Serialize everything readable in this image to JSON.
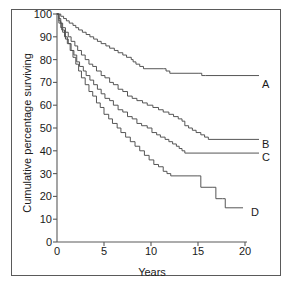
{
  "chart_data": {
    "type": "line",
    "subtype": "kaplan-meier-step",
    "title": "",
    "xlabel": "Years",
    "ylabel": "Cumulative percentage surviving",
    "xlim": [
      0,
      20
    ],
    "ylim": [
      0,
      100
    ],
    "xticks": [
      0,
      5,
      10,
      15,
      20
    ],
    "xtick_labels": [
      "0",
      "5",
      "10",
      "15",
      "20"
    ],
    "yticks": [
      0,
      10,
      20,
      30,
      40,
      50,
      60,
      70,
      80,
      90,
      100
    ],
    "ytick_labels": [
      "0",
      "10",
      "20",
      "30",
      "40",
      "50",
      "60",
      "70",
      "80",
      "90",
      "100"
    ],
    "grid": false,
    "legend_position": "right-inline",
    "line_color": "#4d4d4d",
    "axis_color": "#5a5a5a",
    "series": [
      {
        "name": "A",
        "label": "A",
        "end_value": 74,
        "points": [
          [
            0.0,
            100
          ],
          [
            0.4,
            99
          ],
          [
            0.7,
            98
          ],
          [
            1.0,
            97
          ],
          [
            1.3,
            96
          ],
          [
            1.7,
            95
          ],
          [
            2.0,
            94
          ],
          [
            2.3,
            93
          ],
          [
            2.7,
            92
          ],
          [
            3.1,
            91
          ],
          [
            3.5,
            90
          ],
          [
            3.9,
            89
          ],
          [
            4.3,
            88
          ],
          [
            4.7,
            87
          ],
          [
            5.2,
            86
          ],
          [
            5.6,
            85
          ],
          [
            6.1,
            84
          ],
          [
            6.5,
            83
          ],
          [
            7.0,
            82
          ],
          [
            7.4,
            81
          ],
          [
            7.9,
            80
          ],
          [
            8.1,
            79
          ],
          [
            8.4,
            78
          ],
          [
            8.8,
            77
          ],
          [
            9.2,
            76
          ],
          [
            11.3,
            76
          ],
          [
            11.6,
            75
          ],
          [
            12.0,
            74
          ],
          [
            15.1,
            74
          ],
          [
            15.4,
            73
          ],
          [
            15.8,
            73
          ],
          [
            20.0,
            73
          ]
        ]
      },
      {
        "name": "B",
        "label": "B",
        "end_value": 45,
        "points": [
          [
            0.0,
            100
          ],
          [
            0.2,
            98
          ],
          [
            0.4,
            96
          ],
          [
            0.6,
            94
          ],
          [
            0.9,
            92
          ],
          [
            1.2,
            90
          ],
          [
            1.5,
            88
          ],
          [
            1.9,
            86
          ],
          [
            2.2,
            84
          ],
          [
            2.6,
            82
          ],
          [
            3.0,
            80
          ],
          [
            3.4,
            78
          ],
          [
            3.8,
            77
          ],
          [
            4.2,
            75
          ],
          [
            4.7,
            73
          ],
          [
            5.1,
            72
          ],
          [
            5.6,
            70
          ],
          [
            6.0,
            69
          ],
          [
            6.5,
            67
          ],
          [
            7.0,
            66
          ],
          [
            7.5,
            64
          ],
          [
            8.0,
            63
          ],
          [
            8.5,
            62
          ],
          [
            9.1,
            61
          ],
          [
            9.6,
            60
          ],
          [
            10.2,
            59
          ],
          [
            10.8,
            58
          ],
          [
            11.3,
            57
          ],
          [
            11.9,
            56
          ],
          [
            12.4,
            55
          ],
          [
            12.9,
            54
          ],
          [
            13.3,
            53
          ],
          [
            13.6,
            51
          ],
          [
            14.0,
            50
          ],
          [
            14.4,
            49
          ],
          [
            14.8,
            48
          ],
          [
            15.3,
            47
          ],
          [
            15.7,
            46
          ],
          [
            16.1,
            45
          ],
          [
            20.0,
            45
          ]
        ]
      },
      {
        "name": "C",
        "label": "C",
        "end_value": 39,
        "points": [
          [
            0.0,
            100
          ],
          [
            0.2,
            97
          ],
          [
            0.4,
            94
          ],
          [
            0.6,
            92
          ],
          [
            0.9,
            89
          ],
          [
            1.2,
            87
          ],
          [
            1.5,
            84
          ],
          [
            1.8,
            82
          ],
          [
            2.1,
            79
          ],
          [
            2.4,
            77
          ],
          [
            2.8,
            75
          ],
          [
            3.1,
            73
          ],
          [
            3.5,
            71
          ],
          [
            3.9,
            69
          ],
          [
            4.3,
            67
          ],
          [
            4.7,
            65
          ],
          [
            5.1,
            63
          ],
          [
            5.6,
            62
          ],
          [
            6.0,
            60
          ],
          [
            6.5,
            58
          ],
          [
            7.0,
            57
          ],
          [
            7.5,
            55
          ],
          [
            8.0,
            54
          ],
          [
            8.5,
            52
          ],
          [
            9.0,
            51
          ],
          [
            9.6,
            50
          ],
          [
            10.1,
            48
          ],
          [
            10.6,
            47
          ],
          [
            11.0,
            46
          ],
          [
            11.5,
            45
          ],
          [
            11.9,
            44
          ],
          [
            12.3,
            43
          ],
          [
            12.7,
            42
          ],
          [
            13.0,
            41
          ],
          [
            13.3,
            40
          ],
          [
            13.6,
            39
          ],
          [
            20.0,
            39
          ]
        ]
      },
      {
        "name": "D",
        "label": "D",
        "end_value": 15,
        "points": [
          [
            0.0,
            100
          ],
          [
            0.2,
            96
          ],
          [
            0.5,
            93
          ],
          [
            0.8,
            90
          ],
          [
            1.1,
            87
          ],
          [
            1.4,
            84
          ],
          [
            1.7,
            81
          ],
          [
            2.0,
            78
          ],
          [
            2.3,
            75
          ],
          [
            2.6,
            72
          ],
          [
            3.0,
            69
          ],
          [
            3.4,
            66
          ],
          [
            3.8,
            64
          ],
          [
            4.2,
            61
          ],
          [
            4.6,
            59
          ],
          [
            5.0,
            56
          ],
          [
            5.5,
            54
          ],
          [
            5.9,
            52
          ],
          [
            6.4,
            50
          ],
          [
            6.8,
            48
          ],
          [
            7.3,
            46
          ],
          [
            7.8,
            44
          ],
          [
            8.3,
            42
          ],
          [
            8.8,
            40
          ],
          [
            9.3,
            38
          ],
          [
            9.8,
            36
          ],
          [
            10.3,
            34
          ],
          [
            10.8,
            33
          ],
          [
            11.3,
            31
          ],
          [
            11.7,
            30
          ],
          [
            12.1,
            29
          ],
          [
            14.9,
            29
          ],
          [
            15.3,
            24
          ],
          [
            16.5,
            24
          ],
          [
            16.9,
            19
          ],
          [
            17.6,
            19
          ],
          [
            17.9,
            15
          ],
          [
            18.3,
            15
          ]
        ]
      }
    ],
    "annotations": [
      {
        "text": "A",
        "x": 20.6,
        "y": 73
      },
      {
        "text": "B",
        "x": 20.6,
        "y": 45
      },
      {
        "text": "C",
        "x": 20.6,
        "y": 39
      },
      {
        "text": "D",
        "x": 19.4,
        "y": 15
      }
    ]
  }
}
